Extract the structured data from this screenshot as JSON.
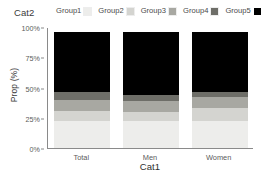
{
  "legend": {
    "title": "Cat2",
    "entries": [
      {
        "label": "Group1",
        "color": "#ededeb"
      },
      {
        "label": "Group2",
        "color": "#d4d4d0"
      },
      {
        "label": "Group3",
        "color": "#a8a8a2"
      },
      {
        "label": "Group4",
        "color": "#6e6e68"
      },
      {
        "label": "Group5",
        "color": "#000000"
      }
    ]
  },
  "chart_data": {
    "type": "bar",
    "subtype": "stacked-percent",
    "title": "",
    "xlabel": "Cat1",
    "ylabel": "Prop (%)",
    "categories": [
      "Total",
      "Men",
      "Women"
    ],
    "ytick_labels": [
      "0%",
      "25%",
      "50%",
      "75%",
      "100%"
    ],
    "ytick_values": [
      0,
      25,
      50,
      75,
      100
    ],
    "ylim": [
      0,
      100
    ],
    "grid": false,
    "legend_position": "top",
    "series": [
      {
        "name": "Group1",
        "color": "#ededeb",
        "values": [
          22,
          22,
          22
        ]
      },
      {
        "name": "Group2",
        "color": "#d4d4d0",
        "values": [
          9,
          8,
          11
        ]
      },
      {
        "name": "Group3",
        "color": "#a8a8a2",
        "values": [
          9,
          9,
          9
        ]
      },
      {
        "name": "Group4",
        "color": "#6e6e68",
        "values": [
          6,
          5,
          4
        ]
      },
      {
        "name": "Group5",
        "color": "#000000",
        "values": [
          50,
          52,
          50
        ]
      }
    ]
  }
}
